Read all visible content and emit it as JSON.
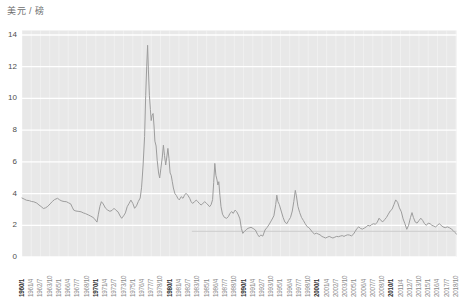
{
  "chart": {
    "unit_label": "美元 / 磅"
  },
  "chart_data": {
    "type": "line",
    "title": "",
    "xlabel": "",
    "ylabel": "美元 / 磅",
    "ylim": [
      0,
      14
    ],
    "y_ticks": [
      0,
      2,
      4,
      6,
      8,
      10,
      12,
      14
    ],
    "xlim_years": [
      1960.0,
      2018.83
    ],
    "grid": "horizontal white gridlines every 2 units on gray plot background, faint vertical lines at each x tick",
    "legend": "none",
    "x_ticks": [
      {
        "label": "1960/1",
        "bold": true
      },
      {
        "label": "1961/4",
        "bold": false
      },
      {
        "label": "1962/7",
        "bold": false
      },
      {
        "label": "1963/10",
        "bold": false
      },
      {
        "label": "1965/1",
        "bold": false
      },
      {
        "label": "1966/4",
        "bold": false
      },
      {
        "label": "1967/7",
        "bold": false
      },
      {
        "label": "1968/10",
        "bold": false
      },
      {
        "label": "1970/1",
        "bold": true
      },
      {
        "label": "1971/4",
        "bold": false
      },
      {
        "label": "1972/7",
        "bold": false
      },
      {
        "label": "1973/10",
        "bold": false
      },
      {
        "label": "1975/1",
        "bold": false
      },
      {
        "label": "1976/4",
        "bold": false
      },
      {
        "label": "1977/7",
        "bold": false
      },
      {
        "label": "1978/10",
        "bold": false
      },
      {
        "label": "1980/1",
        "bold": true
      },
      {
        "label": "1981/4",
        "bold": false
      },
      {
        "label": "1982/7",
        "bold": false
      },
      {
        "label": "1983/10",
        "bold": false
      },
      {
        "label": "1985/1",
        "bold": false
      },
      {
        "label": "1986/4",
        "bold": false
      },
      {
        "label": "1987/7",
        "bold": false
      },
      {
        "label": "1988/10",
        "bold": false
      },
      {
        "label": "1990/1",
        "bold": true
      },
      {
        "label": "1991/4",
        "bold": false
      },
      {
        "label": "1992/7",
        "bold": false
      },
      {
        "label": "1993/10",
        "bold": false
      },
      {
        "label": "1995/1",
        "bold": false
      },
      {
        "label": "1996/4",
        "bold": false
      },
      {
        "label": "1997/7",
        "bold": false
      },
      {
        "label": "1998/10",
        "bold": false
      },
      {
        "label": "2000/1",
        "bold": true
      },
      {
        "label": "2001/4",
        "bold": false
      },
      {
        "label": "2002/7",
        "bold": false
      },
      {
        "label": "2003/10",
        "bold": false
      },
      {
        "label": "2005/1",
        "bold": false
      },
      {
        "label": "2006/4",
        "bold": false
      },
      {
        "label": "2007/7",
        "bold": false
      },
      {
        "label": "2008/10",
        "bold": false
      },
      {
        "label": "2010/1",
        "bold": true
      },
      {
        "label": "2011/4",
        "bold": false
      },
      {
        "label": "2012/7",
        "bold": false
      },
      {
        "label": "2013/10",
        "bold": false
      },
      {
        "label": "2015/1",
        "bold": false
      },
      {
        "label": "2016/4",
        "bold": false
      },
      {
        "label": "2017/7",
        "bold": false
      },
      {
        "label": "2018/10",
        "bold": false
      }
    ],
    "reference_line": {
      "value": 1.62,
      "from_year": 1983,
      "to_year": 2018.83,
      "color": "#cccccc"
    },
    "colors": {
      "plot_bg": "#e8e8e8",
      "gridline": "#ffffff",
      "series_line": "#9d9d9d",
      "unit_text": "#6e6e6e",
      "y_tick_text": "#4d4d4d",
      "x_tick_text": "#8a8a8a",
      "x_tick_text_bold": "#2e2e2e"
    },
    "series": [
      {
        "name": "price-usd-per-pound",
        "color": "#9d9d9d",
        "points": [
          [
            1960.0,
            3.72
          ],
          [
            1960.3,
            3.65
          ],
          [
            1960.6,
            3.58
          ],
          [
            1961.0,
            3.55
          ],
          [
            1961.3,
            3.5
          ],
          [
            1961.6,
            3.48
          ],
          [
            1962.0,
            3.4
          ],
          [
            1962.3,
            3.28
          ],
          [
            1962.6,
            3.18
          ],
          [
            1962.9,
            3.06
          ],
          [
            1963.2,
            3.1
          ],
          [
            1963.5,
            3.2
          ],
          [
            1963.8,
            3.35
          ],
          [
            1964.1,
            3.5
          ],
          [
            1964.4,
            3.62
          ],
          [
            1964.8,
            3.7
          ],
          [
            1965.1,
            3.6
          ],
          [
            1965.4,
            3.53
          ],
          [
            1965.7,
            3.5
          ],
          [
            1966.0,
            3.49
          ],
          [
            1966.3,
            3.42
          ],
          [
            1966.6,
            3.35
          ],
          [
            1966.8,
            3.15
          ],
          [
            1967.0,
            2.96
          ],
          [
            1967.3,
            2.9
          ],
          [
            1967.6,
            2.88
          ],
          [
            1968.0,
            2.85
          ],
          [
            1968.3,
            2.78
          ],
          [
            1968.6,
            2.74
          ],
          [
            1969.0,
            2.65
          ],
          [
            1969.3,
            2.58
          ],
          [
            1969.6,
            2.5
          ],
          [
            1969.8,
            2.42
          ],
          [
            1970.0,
            2.28
          ],
          [
            1970.15,
            2.2
          ],
          [
            1970.35,
            2.7
          ],
          [
            1970.55,
            3.2
          ],
          [
            1970.75,
            3.49
          ],
          [
            1971.0,
            3.35
          ],
          [
            1971.3,
            3.08
          ],
          [
            1971.6,
            2.96
          ],
          [
            1971.9,
            2.88
          ],
          [
            1972.2,
            2.94
          ],
          [
            1972.45,
            3.07
          ],
          [
            1972.7,
            2.96
          ],
          [
            1973.0,
            2.85
          ],
          [
            1973.3,
            2.58
          ],
          [
            1973.5,
            2.44
          ],
          [
            1973.75,
            2.6
          ],
          [
            1974.0,
            2.78
          ],
          [
            1974.25,
            3.17
          ],
          [
            1974.5,
            3.38
          ],
          [
            1974.75,
            3.59
          ],
          [
            1975.0,
            3.38
          ],
          [
            1975.25,
            3.07
          ],
          [
            1975.5,
            3.22
          ],
          [
            1975.75,
            3.5
          ],
          [
            1976.0,
            3.72
          ],
          [
            1976.2,
            4.4
          ],
          [
            1976.4,
            5.8
          ],
          [
            1976.6,
            7.6
          ],
          [
            1976.75,
            10.2
          ],
          [
            1976.88,
            12.0
          ],
          [
            1977.0,
            13.35
          ],
          [
            1977.12,
            11.8
          ],
          [
            1977.25,
            10.2
          ],
          [
            1977.38,
            9.3
          ],
          [
            1977.5,
            8.6
          ],
          [
            1977.62,
            8.95
          ],
          [
            1977.75,
            9.05
          ],
          [
            1977.88,
            8.2
          ],
          [
            1978.0,
            7.3
          ],
          [
            1978.15,
            7.0
          ],
          [
            1978.3,
            6.1
          ],
          [
            1978.5,
            5.3
          ],
          [
            1978.65,
            4.98
          ],
          [
            1978.8,
            5.6
          ],
          [
            1979.0,
            6.3
          ],
          [
            1979.15,
            7.05
          ],
          [
            1979.3,
            6.4
          ],
          [
            1979.45,
            5.8
          ],
          [
            1979.6,
            6.3
          ],
          [
            1979.75,
            6.85
          ],
          [
            1979.9,
            6.2
          ],
          [
            1980.05,
            5.3
          ],
          [
            1980.2,
            5.15
          ],
          [
            1980.35,
            4.75
          ],
          [
            1980.5,
            4.35
          ],
          [
            1980.7,
            4.0
          ],
          [
            1980.9,
            3.88
          ],
          [
            1981.1,
            3.7
          ],
          [
            1981.3,
            3.6
          ],
          [
            1981.55,
            3.8
          ],
          [
            1981.8,
            3.7
          ],
          [
            1982.0,
            3.9
          ],
          [
            1982.2,
            4.02
          ],
          [
            1982.45,
            3.9
          ],
          [
            1982.7,
            3.7
          ],
          [
            1982.9,
            3.49
          ],
          [
            1983.1,
            3.38
          ],
          [
            1983.35,
            3.49
          ],
          [
            1983.6,
            3.59
          ],
          [
            1983.8,
            3.49
          ],
          [
            1984.0,
            3.38
          ],
          [
            1984.25,
            3.28
          ],
          [
            1984.5,
            3.38
          ],
          [
            1984.75,
            3.49
          ],
          [
            1985.0,
            3.38
          ],
          [
            1985.2,
            3.28
          ],
          [
            1985.4,
            3.17
          ],
          [
            1985.6,
            3.3
          ],
          [
            1985.8,
            3.62
          ],
          [
            1985.95,
            4.7
          ],
          [
            1986.1,
            5.9
          ],
          [
            1986.25,
            5.15
          ],
          [
            1986.4,
            4.86
          ],
          [
            1986.52,
            4.54
          ],
          [
            1986.64,
            4.75
          ],
          [
            1986.8,
            3.9
          ],
          [
            1986.95,
            3.17
          ],
          [
            1987.15,
            2.7
          ],
          [
            1987.4,
            2.5
          ],
          [
            1987.7,
            2.44
          ],
          [
            1987.95,
            2.55
          ],
          [
            1988.15,
            2.75
          ],
          [
            1988.4,
            2.86
          ],
          [
            1988.6,
            2.75
          ],
          [
            1988.85,
            2.96
          ],
          [
            1989.05,
            2.86
          ],
          [
            1989.3,
            2.65
          ],
          [
            1989.5,
            2.4
          ],
          [
            1989.7,
            1.8
          ],
          [
            1989.9,
            1.49
          ],
          [
            1990.1,
            1.6
          ],
          [
            1990.35,
            1.72
          ],
          [
            1990.6,
            1.81
          ],
          [
            1991.0,
            1.87
          ],
          [
            1991.3,
            1.8
          ],
          [
            1991.6,
            1.7
          ],
          [
            1991.9,
            1.42
          ],
          [
            1992.1,
            1.28
          ],
          [
            1992.35,
            1.39
          ],
          [
            1992.6,
            1.32
          ],
          [
            1992.9,
            1.7
          ],
          [
            1993.2,
            1.87
          ],
          [
            1993.5,
            2.08
          ],
          [
            1993.8,
            2.33
          ],
          [
            1994.1,
            2.6
          ],
          [
            1994.35,
            3.3
          ],
          [
            1994.5,
            3.9
          ],
          [
            1994.65,
            3.5
          ],
          [
            1994.85,
            3.3
          ],
          [
            1995.1,
            2.9
          ],
          [
            1995.35,
            2.5
          ],
          [
            1995.6,
            2.2
          ],
          [
            1995.85,
            2.1
          ],
          [
            1996.1,
            2.3
          ],
          [
            1996.35,
            2.5
          ],
          [
            1996.6,
            2.9
          ],
          [
            1996.8,
            3.5
          ],
          [
            1997.0,
            4.2
          ],
          [
            1997.15,
            3.85
          ],
          [
            1997.35,
            3.2
          ],
          [
            1997.6,
            2.8
          ],
          [
            1997.85,
            2.5
          ],
          [
            1998.1,
            2.3
          ],
          [
            1998.35,
            2.1
          ],
          [
            1998.6,
            1.92
          ],
          [
            1998.85,
            1.85
          ],
          [
            1999.1,
            1.7
          ],
          [
            1999.35,
            1.55
          ],
          [
            1999.6,
            1.45
          ],
          [
            1999.85,
            1.5
          ],
          [
            2000.1,
            1.45
          ],
          [
            2000.35,
            1.4
          ],
          [
            2000.6,
            1.3
          ],
          [
            2000.85,
            1.25
          ],
          [
            2001.1,
            1.2
          ],
          [
            2001.35,
            1.25
          ],
          [
            2001.6,
            1.3
          ],
          [
            2001.85,
            1.24
          ],
          [
            2002.1,
            1.2
          ],
          [
            2002.35,
            1.25
          ],
          [
            2002.6,
            1.3
          ],
          [
            2002.85,
            1.28
          ],
          [
            2003.1,
            1.32
          ],
          [
            2003.35,
            1.35
          ],
          [
            2003.6,
            1.3
          ],
          [
            2003.85,
            1.36
          ],
          [
            2004.1,
            1.4
          ],
          [
            2004.35,
            1.38
          ],
          [
            2004.6,
            1.33
          ],
          [
            2004.85,
            1.42
          ],
          [
            2005.1,
            1.6
          ],
          [
            2005.35,
            1.8
          ],
          [
            2005.6,
            1.9
          ],
          [
            2005.85,
            1.8
          ],
          [
            2006.1,
            1.76
          ],
          [
            2006.35,
            1.82
          ],
          [
            2006.6,
            1.9
          ],
          [
            2006.85,
            2.0
          ],
          [
            2007.1,
            1.95
          ],
          [
            2007.35,
            2.05
          ],
          [
            2007.6,
            2.1
          ],
          [
            2007.85,
            2.06
          ],
          [
            2008.1,
            2.2
          ],
          [
            2008.35,
            2.45
          ],
          [
            2008.6,
            2.3
          ],
          [
            2008.85,
            2.22
          ],
          [
            2009.1,
            2.35
          ],
          [
            2009.35,
            2.5
          ],
          [
            2009.6,
            2.7
          ],
          [
            2009.85,
            2.9
          ],
          [
            2010.1,
            3.0
          ],
          [
            2010.35,
            3.3
          ],
          [
            2010.6,
            3.6
          ],
          [
            2010.85,
            3.45
          ],
          [
            2011.1,
            3.1
          ],
          [
            2011.35,
            2.85
          ],
          [
            2011.6,
            2.4
          ],
          [
            2011.85,
            2.1
          ],
          [
            2012.1,
            1.75
          ],
          [
            2012.35,
            2.0
          ],
          [
            2012.6,
            2.5
          ],
          [
            2012.8,
            2.8
          ],
          [
            2013.0,
            2.5
          ],
          [
            2013.25,
            2.2
          ],
          [
            2013.5,
            2.14
          ],
          [
            2013.75,
            2.3
          ],
          [
            2014.0,
            2.45
          ],
          [
            2014.25,
            2.3
          ],
          [
            2014.5,
            2.1
          ],
          [
            2014.75,
            2.0
          ],
          [
            2015.0,
            2.14
          ],
          [
            2015.25,
            2.1
          ],
          [
            2015.5,
            2.0
          ],
          [
            2015.75,
            1.95
          ],
          [
            2016.0,
            1.9
          ],
          [
            2016.25,
            2.0
          ],
          [
            2016.5,
            2.1
          ],
          [
            2016.75,
            2.0
          ],
          [
            2017.0,
            1.9
          ],
          [
            2017.3,
            1.85
          ],
          [
            2017.6,
            1.9
          ],
          [
            2017.85,
            1.85
          ],
          [
            2018.1,
            1.78
          ],
          [
            2018.35,
            1.68
          ],
          [
            2018.6,
            1.55
          ],
          [
            2018.83,
            1.45
          ]
        ]
      }
    ]
  }
}
